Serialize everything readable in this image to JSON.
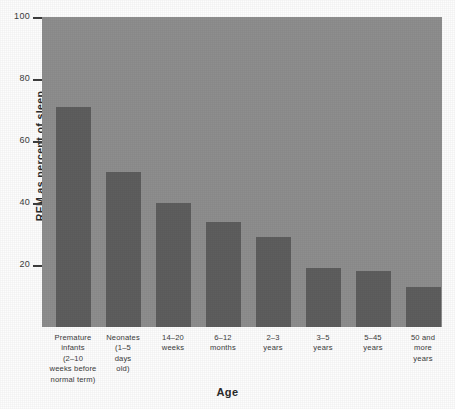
{
  "chart_data": {
    "type": "bar",
    "title": "",
    "xlabel": "Age",
    "ylabel": "REM as percent of sleep",
    "ylim": [
      0,
      100
    ],
    "yticks": [
      20,
      40,
      60,
      80,
      100
    ],
    "ytick_labels": [
      "20",
      "40",
      "60",
      "80",
      "100"
    ],
    "grid": false,
    "legend": null,
    "categories": [
      "Premature infants (2–10 weeks before normal term)",
      "Neonates (1–5 days old)",
      "14–20 weeks",
      "6–12 months",
      "2–3 years",
      "3–5 years",
      "5–45 years",
      "50 and more years"
    ],
    "category_lines": [
      [
        "Premature",
        "infants",
        "(2–10",
        "weeks before",
        "normal term)"
      ],
      [
        "Neonates",
        "(1–5",
        "days",
        "old)"
      ],
      [
        "14–20",
        "weeks"
      ],
      [
        "6–12",
        "months"
      ],
      [
        "2–3",
        "years"
      ],
      [
        "3–5",
        "years"
      ],
      [
        "5–45",
        "years"
      ],
      [
        "50 and",
        "more",
        "years"
      ]
    ],
    "values": [
      71,
      50,
      40,
      34,
      29,
      19,
      18,
      13
    ],
    "bar_color": "#5e5e5e",
    "plot_background": "#8e8e8e",
    "figure_background": "#fdfdfd"
  }
}
